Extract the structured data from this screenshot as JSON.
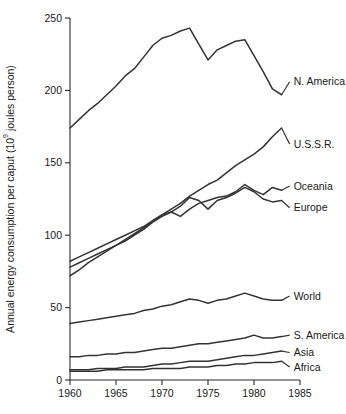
{
  "chart_data": {
    "type": "line",
    "title": "",
    "xlabel": "",
    "ylabel_main": "Annual energy consumption per caput (10",
    "ylabel_sup": "9",
    "ylabel_tail": " joules person)",
    "ylabel_full": "Annual energy consumption per caput (10⁹ joules person)",
    "xlim": [
      1960,
      1985
    ],
    "ylim": [
      0,
      250
    ],
    "xticks": [
      1960,
      1965,
      1970,
      1975,
      1980,
      1985
    ],
    "xtick_labels": [
      "1960",
      "1965",
      "1970",
      "1975",
      "1980",
      "1985"
    ],
    "yticks": [
      0,
      50,
      100,
      150,
      200,
      250
    ],
    "ytick_labels": [
      "0",
      "50",
      "100",
      "150",
      "200",
      "250"
    ],
    "grid": false,
    "legend_position": "right-inline-labels",
    "line_color": "#333333",
    "x": [
      1960,
      1961,
      1962,
      1963,
      1964,
      1965,
      1966,
      1967,
      1968,
      1969,
      1970,
      1971,
      1972,
      1973,
      1974,
      1975,
      1976,
      1977,
      1978,
      1979,
      1980,
      1981,
      1982,
      1983
    ],
    "series": [
      {
        "name": "N. America",
        "label": "N. America",
        "label_x": 1984.2,
        "label_y": 206,
        "values": [
          174,
          180,
          186,
          191,
          197,
          203,
          210,
          215,
          223,
          231,
          236,
          238,
          241,
          243,
          232,
          221,
          228,
          231,
          234,
          235,
          224,
          213,
          201,
          197
        ]
      },
      {
        "name": "U.S.S.R.",
        "label": "U.S.S.R.",
        "label_x": 1984.2,
        "label_y": 163,
        "values": [
          72,
          76,
          81,
          85,
          89,
          93,
          97,
          101,
          105,
          110,
          114,
          118,
          122,
          127,
          131,
          135,
          138,
          143,
          148,
          152,
          156,
          161,
          168,
          174
        ]
      },
      {
        "name": "Oceania",
        "label": "Oceania",
        "label_x": 1984.2,
        "label_y": 134,
        "values": [
          82,
          85,
          88,
          91,
          94,
          97,
          100,
          103,
          106,
          110,
          114,
          116,
          113,
          118,
          122,
          124,
          126,
          127,
          130,
          135,
          131,
          128,
          133,
          131
        ]
      },
      {
        "name": "Europe",
        "label": "Europe",
        "label_x": 1984.2,
        "label_y": 119,
        "values": [
          78,
          81,
          84,
          87,
          90,
          93,
          96,
          100,
          104,
          109,
          113,
          116,
          120,
          126,
          124,
          118,
          124,
          126,
          129,
          133,
          130,
          125,
          123,
          124
        ]
      },
      {
        "name": "World",
        "label": "World",
        "label_x": 1984.2,
        "label_y": 58,
        "values": [
          39,
          40,
          41,
          42,
          43,
          44,
          45,
          46,
          48,
          49,
          51,
          52,
          54,
          56,
          55,
          53,
          55,
          56,
          58,
          60,
          58,
          56,
          55,
          55
        ]
      },
      {
        "name": "S. America",
        "label": "S. America",
        "label_x": 1984.2,
        "label_y": 31,
        "values": [
          16,
          16,
          17,
          17,
          18,
          18,
          19,
          19,
          20,
          21,
          22,
          22,
          23,
          24,
          25,
          25,
          26,
          27,
          28,
          29,
          31,
          29,
          29,
          30
        ]
      },
      {
        "name": "Asia",
        "label": "Asia",
        "label_x": 1984.2,
        "label_y": 19,
        "values": [
          7,
          7,
          7,
          8,
          8,
          8,
          9,
          9,
          9,
          10,
          11,
          11,
          12,
          13,
          13,
          13,
          14,
          15,
          16,
          17,
          17,
          18,
          19,
          20
        ]
      },
      {
        "name": "Africa",
        "label": "Africa",
        "label_x": 1984.2,
        "label_y": 9,
        "values": [
          6,
          6,
          6,
          6,
          7,
          7,
          7,
          7,
          7,
          8,
          8,
          8,
          8,
          9,
          9,
          9,
          10,
          10,
          11,
          11,
          12,
          12,
          12,
          13
        ]
      }
    ]
  }
}
